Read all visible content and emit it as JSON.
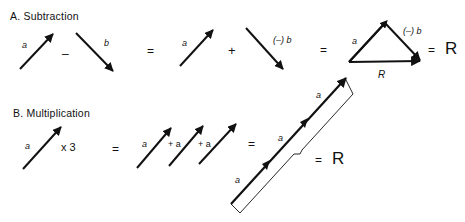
{
  "section_a": {
    "title": "A. Subtraction",
    "vec_a_label": "a",
    "minus": "–",
    "vec_b_label": "b",
    "equals1": "=",
    "vec_a2_label": "a",
    "plus": "+",
    "neg_b_label": "(–) b",
    "equals2": "=",
    "tri_a_label": "a",
    "tri_negb_label": "(–) b",
    "tri_R_label": "R",
    "equals3": "=",
    "result": "R"
  },
  "section_b": {
    "title": "B. Multiplication",
    "vec_a_label": "a",
    "times": "x 3",
    "equals1": "=",
    "sum_a1": "a",
    "sum_plus1": "+ a",
    "sum_plus2": "+ a",
    "equals2": "=",
    "long_a1": "a",
    "long_a2": "a",
    "long_a3": "a",
    "equals3": "=",
    "result": "R"
  },
  "colors": {
    "ink": "#111111",
    "background": "#ffffff"
  }
}
